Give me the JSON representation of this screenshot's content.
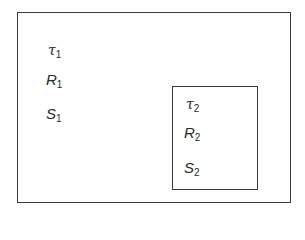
{
  "diagram": {
    "outer_region": {
      "labels": [
        {
          "symbol": "τ",
          "subscript": "1"
        },
        {
          "symbol": "R",
          "subscript": "1"
        },
        {
          "symbol": "S",
          "subscript": "1"
        }
      ]
    },
    "inner_region": {
      "labels": [
        {
          "symbol": "τ",
          "subscript": "2"
        },
        {
          "symbol": "R",
          "subscript": "2"
        },
        {
          "symbol": "S",
          "subscript": "2"
        }
      ]
    },
    "colors": {
      "stroke": "#3a3a3a",
      "text": "#2a2a2a",
      "background": "#ffffff"
    }
  }
}
